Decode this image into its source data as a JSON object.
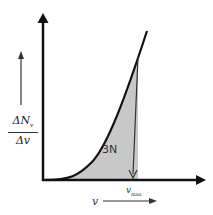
{
  "diagram": {
    "y_axis_label": {
      "numerator": "ΔN",
      "numerator_sub": "v",
      "denominator": "Δv"
    },
    "x_axis_label": "v",
    "cutoff_label": "v",
    "cutoff_sub": "max",
    "area_label": "3N",
    "colors": {
      "axis": "#111111",
      "curve": "#111111",
      "shade": "#c8c8c8",
      "background": "#ffffff"
    }
  }
}
